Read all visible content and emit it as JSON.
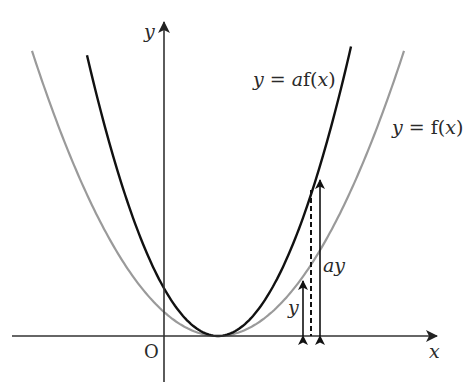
{
  "diagram": {
    "colors": {
      "background": "#ffffff",
      "axis": "#333333",
      "curve_af": "#111111",
      "curve_f": "#9a9a9a",
      "arrow": "#111111",
      "text": "#2a2a2a"
    },
    "axes": {
      "x_label": "x",
      "y_label": "y",
      "origin_label": "O",
      "x_axis": {
        "x1": 12,
        "x2": 437,
        "y": 336
      },
      "y_axis": {
        "x": 164,
        "y1": 382,
        "y2": 22
      }
    },
    "curves": [
      {
        "id": "af",
        "label": "y = af(x)",
        "label_parts": {
          "lhs": "y",
          "eq": " = ",
          "coef": "a",
          "fn": "f(",
          "var": "x",
          "close": ")"
        },
        "vertex": [
          218,
          336
        ],
        "k": 0.01636,
        "x_range": [
          87,
          351
        ],
        "stroke_width": 2.4,
        "label_pos": [
          253,
          86
        ]
      },
      {
        "id": "f",
        "label": "y = f(x)",
        "label_parts": {
          "lhs": "y",
          "eq": " = ",
          "fn": "f(",
          "var": "x",
          "close": ")"
        },
        "vertex": [
          218,
          336
        ],
        "k": 0.00824,
        "x_range": [
          32,
          405
        ],
        "stroke_width": 2.2,
        "label_pos": [
          392,
          134
        ]
      }
    ],
    "annotations": {
      "arrow_y": {
        "label": "y",
        "x": 303,
        "y_top": 281,
        "y_bottom": 336,
        "label_pos": [
          288,
          314
        ]
      },
      "arrow_ay": {
        "label": "ay",
        "x": 320,
        "y_top": 180,
        "y_bottom": 336,
        "label_pos": [
          323,
          272
        ]
      },
      "dashed_line": {
        "x": 311,
        "y_top": 190,
        "y_bottom": 336
      }
    }
  }
}
